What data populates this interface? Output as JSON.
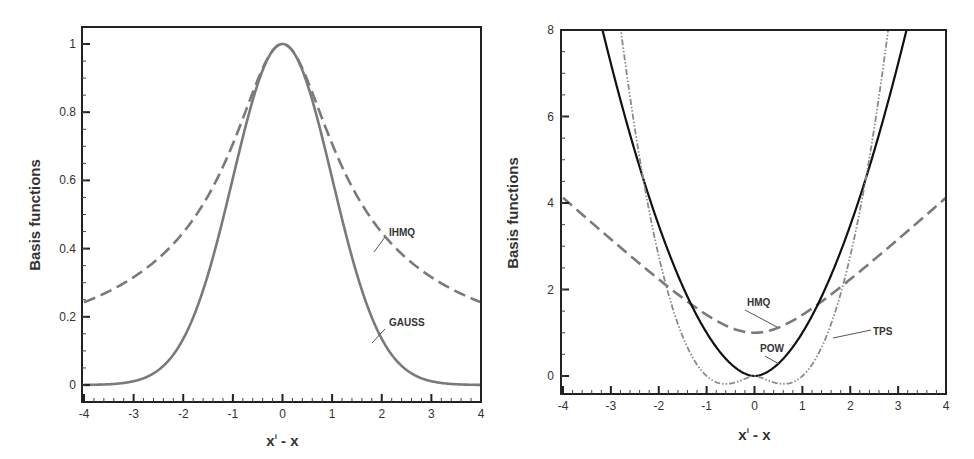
{
  "chart_data": [
    {
      "type": "line",
      "panel": "left",
      "title": "",
      "xlabel": "x^i - x",
      "xlabel_main": "x",
      "xlabel_sup": "i",
      "xlabel_tail": " - x",
      "ylabel": "Basis functions",
      "xlim": [
        -4,
        4
      ],
      "ylim": [
        -0.05,
        1.05
      ],
      "xticks": [
        -4,
        -3,
        -2,
        -1,
        0,
        1,
        2,
        3,
        4
      ],
      "xtick_labels": [
        "-4",
        "-3",
        "-2",
        "-1",
        "0",
        "1",
        "2",
        "3",
        "4"
      ],
      "yticks": [
        0,
        0.2,
        0.4,
        0.6,
        0.8,
        1
      ],
      "ytick_labels": [
        "0",
        "0.2",
        "0.4",
        "0.6",
        "0.8",
        "1"
      ],
      "grid": false,
      "x": [
        -4,
        -3.5,
        -3,
        -2.5,
        -2,
        -1.5,
        -1,
        -0.5,
        0,
        0.5,
        1,
        1.5,
        2,
        2.5,
        3,
        3.5,
        4
      ],
      "series": [
        {
          "name": "IHMQ",
          "style": "dashed",
          "color": "#7a7a7a",
          "values": [
            0.243,
            0.275,
            0.316,
            0.371,
            0.447,
            0.555,
            0.707,
            0.894,
            1.0,
            0.894,
            0.707,
            0.555,
            0.447,
            0.371,
            0.316,
            0.275,
            0.243
          ]
        },
        {
          "name": "GAUSS",
          "style": "solid",
          "color": "#7a7a7a",
          "values": [
            0.0003,
            0.002,
            0.011,
            0.044,
            0.135,
            0.325,
            0.607,
            0.882,
            1.0,
            0.882,
            0.607,
            0.325,
            0.135,
            0.044,
            0.011,
            0.002,
            0.0003
          ]
        }
      ],
      "annotations": [
        {
          "text": "IHMQ",
          "x": 2.45,
          "y": 0.46
        },
        {
          "text": "GAUSS",
          "x": 2.4,
          "y": 0.18
        }
      ]
    },
    {
      "type": "line",
      "panel": "right",
      "title": "",
      "xlabel": "x^i - x",
      "xlabel_main": "x",
      "xlabel_sup": "i",
      "xlabel_tail": " - x",
      "ylabel": "Basis functions",
      "xlim": [
        -4,
        4
      ],
      "ylim": [
        -0.4,
        8
      ],
      "xticks": [
        -4,
        -3,
        -2,
        -1,
        0,
        1,
        2,
        3,
        4
      ],
      "xtick_labels": [
        "-4",
        "-3",
        "-2",
        "-1",
        "0",
        "1",
        "2",
        "3",
        "4"
      ],
      "yticks": [
        0,
        2,
        4,
        6,
        8
      ],
      "ytick_labels": [
        "0",
        "2",
        "4",
        "6",
        "8"
      ],
      "grid": false,
      "x": [
        -4,
        -3.5,
        -3,
        -2.5,
        -2,
        -1.5,
        -1,
        -0.5,
        0,
        0.5,
        1,
        1.5,
        2,
        2.5,
        3,
        3.5,
        4
      ],
      "series": [
        {
          "name": "HMQ",
          "style": "dashed",
          "color": "#7a7a7a",
          "values": [
            4.12,
            3.64,
            3.16,
            2.69,
            2.24,
            1.8,
            1.41,
            1.12,
            1.0,
            1.12,
            1.41,
            1.8,
            2.24,
            2.69,
            3.16,
            3.64,
            4.12
          ]
        },
        {
          "name": "POW",
          "style": "solid",
          "color": "#111111",
          "values": [
            null,
            null,
            7.22,
            5.2,
            3.48,
            2.07,
            1.0,
            0.29,
            0.0,
            0.29,
            1.0,
            2.07,
            3.48,
            5.2,
            7.22,
            null,
            null
          ]
        },
        {
          "name": "TPS",
          "style": "dash-dot-dot",
          "color": "#8a8a8a",
          "values": [
            null,
            null,
            null,
            5.73,
            2.77,
            0.91,
            0.0,
            -0.17,
            0.0,
            -0.17,
            0.0,
            0.91,
            2.77,
            5.73,
            null,
            null,
            null
          ]
        }
      ],
      "annotations": [
        {
          "text": "HMQ",
          "x": 0.1,
          "y": 1.65
        },
        {
          "text": "TPS",
          "x": 2.7,
          "y": 1.0
        },
        {
          "text": "POW",
          "x": -0.15,
          "y": 0.65
        }
      ]
    }
  ]
}
